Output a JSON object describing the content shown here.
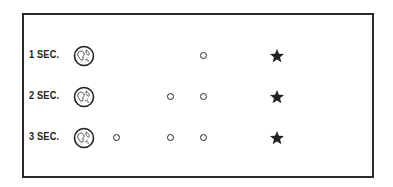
{
  "diagram": {
    "rows": [
      {
        "label": "1 SEC.",
        "object_positions": [
          0.62
        ],
        "star": true
      },
      {
        "label": "2 SEC.",
        "object_positions": [
          0.45,
          0.62
        ],
        "star": true
      },
      {
        "label": "3 SEC.",
        "object_positions": [
          0.17,
          0.45,
          0.62
        ],
        "star": true
      }
    ],
    "icons": {
      "origin": "earth-globe-icon",
      "object": "small-ring-icon",
      "target": "star-icon"
    },
    "colors": {
      "ink": "#222222",
      "frame": "#2a2a2a",
      "background": "#ffffff"
    }
  }
}
